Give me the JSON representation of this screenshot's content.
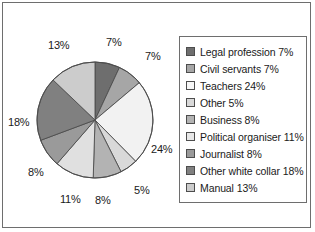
{
  "chart_data": {
    "type": "pie",
    "title": "",
    "legend_position": "right",
    "categories": [
      "Legal profession",
      "Civil servants",
      "Teachers",
      "Other",
      "Business",
      "Political organiser",
      "Journalist",
      "Other white collar",
      "Manual"
    ],
    "values": [
      7,
      7,
      24,
      5,
      8,
      11,
      8,
      18,
      13
    ],
    "value_labels": [
      "7%",
      "7%",
      "24%",
      "5%",
      "8%",
      "11%",
      "8%",
      "18%",
      "13%"
    ],
    "colors": [
      "#6e6e6e",
      "#a6a6a6",
      "#f2f2f2",
      "#d9d9d9",
      "#b3b3b3",
      "#e0e0e0",
      "#9a9a9a",
      "#808080",
      "#cccccc"
    ],
    "start_angle": 0,
    "direction": "clockwise",
    "slice_edge_color": "#4d4d4d"
  },
  "legend": {
    "items": [
      {
        "label": "Legal profession 7%",
        "color": "#6e6e6e"
      },
      {
        "label": "Civil servants 7%",
        "color": "#a6a6a6"
      },
      {
        "label": "Teachers 24%",
        "color": "#f7f7f7"
      },
      {
        "label": "Other 5%",
        "color": "#d9d9d9"
      },
      {
        "label": "Business 8%",
        "color": "#b3b3b3"
      },
      {
        "label": "Political organiser 11%",
        "color": "#e8e8e8"
      },
      {
        "label": "Journalist 8%",
        "color": "#9a9a9a"
      },
      {
        "label": "Other white collar 18%",
        "color": "#808080"
      },
      {
        "label": "Manual 13%",
        "color": "#cccccc"
      }
    ]
  },
  "pie_labels": [
    {
      "text": "7%",
      "x": 103,
      "y": 33
    },
    {
      "text": "7%",
      "x": 142,
      "y": 47
    },
    {
      "text": "24%",
      "x": 148,
      "y": 140
    },
    {
      "text": "5%",
      "x": 131,
      "y": 181
    },
    {
      "text": "8%",
      "x": 92,
      "y": 191
    },
    {
      "text": "11%",
      "x": 57,
      "y": 190
    },
    {
      "text": "8%",
      "x": 25,
      "y": 163
    },
    {
      "text": "18%",
      "x": 5,
      "y": 113
    },
    {
      "text": "13%",
      "x": 45,
      "y": 36
    }
  ]
}
